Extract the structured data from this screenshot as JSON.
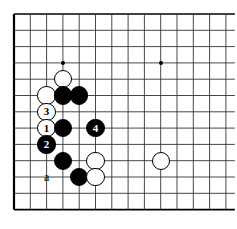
{
  "diagram": {
    "kind": "go-board-diagram",
    "board": {
      "origin_x": 14,
      "origin_y": 14,
      "spacing": 16.3,
      "cols": 14,
      "rows": 13,
      "edges": {
        "left": true,
        "top": true,
        "bottom": true,
        "right": false
      },
      "line_color": "#333333",
      "border_color": "#000000",
      "background": "#ffffff",
      "star_points": [
        {
          "col": 3,
          "row": 3,
          "name": "hoshi-top-left"
        },
        {
          "col": 9,
          "row": 3,
          "name": "hoshi-top-right"
        }
      ]
    },
    "stone_radius": 9.2,
    "stones": [
      {
        "id": "w-d16",
        "color": "white",
        "col": 3,
        "row": 4,
        "label": "",
        "name": "white-stone"
      },
      {
        "id": "w-c15",
        "color": "white",
        "col": 2,
        "row": 5,
        "label": "",
        "name": "white-stone"
      },
      {
        "id": "b-d15",
        "color": "black",
        "col": 3,
        "row": 5,
        "label": "",
        "name": "black-stone"
      },
      {
        "id": "b-e15",
        "color": "black",
        "col": 4,
        "row": 5,
        "label": "",
        "name": "black-stone"
      },
      {
        "id": "w-move-3",
        "color": "white",
        "col": 2,
        "row": 6,
        "label": "3",
        "name": "white-move-3"
      },
      {
        "id": "w-move-1",
        "color": "white",
        "col": 2,
        "row": 7,
        "label": "1",
        "name": "white-move-1"
      },
      {
        "id": "b-d13",
        "color": "black",
        "col": 3,
        "row": 7,
        "label": "",
        "name": "black-stone"
      },
      {
        "id": "b-move-4",
        "color": "black",
        "col": 5,
        "row": 7,
        "label": "4",
        "name": "black-move-4"
      },
      {
        "id": "b-move-2",
        "color": "black",
        "col": 2,
        "row": 8,
        "label": "2",
        "name": "black-move-2"
      },
      {
        "id": "b-d11",
        "color": "black",
        "col": 3,
        "row": 9,
        "label": "",
        "name": "black-stone"
      },
      {
        "id": "w-f11",
        "color": "white",
        "col": 5,
        "row": 9,
        "label": "",
        "name": "white-stone"
      },
      {
        "id": "w-k11",
        "color": "white",
        "col": 9,
        "row": 9,
        "label": "",
        "name": "white-stone"
      },
      {
        "id": "b-e10",
        "color": "black",
        "col": 4,
        "row": 10,
        "label": "",
        "name": "black-stone"
      },
      {
        "id": "w-f10",
        "color": "white",
        "col": 5,
        "row": 10,
        "label": "",
        "name": "white-stone"
      }
    ],
    "point_labels": [
      {
        "id": "label-a",
        "text": "a",
        "col": 2,
        "row": 10,
        "name": "point-label-a"
      }
    ],
    "move_numbers": [
      "1",
      "2",
      "3",
      "4"
    ]
  }
}
